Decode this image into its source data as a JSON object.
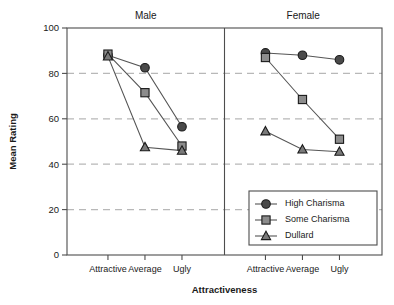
{
  "chart_data": {
    "type": "line",
    "title": "",
    "xlabel": "Attractiveness",
    "ylabel": "Mean Rating",
    "ylim": [
      0,
      100
    ],
    "yticks": [
      0,
      20,
      40,
      60,
      80,
      100
    ],
    "yticklabels": [
      "0",
      "20",
      "40",
      "60",
      "80",
      "100"
    ],
    "grid": "horizontal dashed at 20,40,60,80",
    "categories": [
      "Attractive",
      "Average",
      "Ugly"
    ],
    "panels": [
      {
        "name": "Male",
        "series": [
          {
            "name": "High Charisma",
            "marker": "circle",
            "values": [
              88.0,
              82.5,
              56.5
            ],
            "errors": [
              1.2,
              1.8,
              1.5
            ]
          },
          {
            "name": "Some Charisma",
            "marker": "square",
            "values": [
              88.5,
              71.5,
              48.0
            ],
            "errors": [
              1.3,
              1.5,
              1.5
            ]
          },
          {
            "name": "Dullard",
            "marker": "triangle",
            "values": [
              87.5,
              47.5,
              46.0
            ],
            "errors": [
              1.3,
              1.2,
              1.5
            ]
          }
        ]
      },
      {
        "name": "Female",
        "series": [
          {
            "name": "High Charisma",
            "marker": "circle",
            "values": [
              89.0,
              88.0,
              86.0
            ],
            "errors": [
              1.4,
              1.5,
              1.0
            ]
          },
          {
            "name": "Some Charisma",
            "marker": "square",
            "values": [
              87.0,
              68.5,
              51.0
            ],
            "errors": [
              1.4,
              1.3,
              1.2
            ]
          },
          {
            "name": "Dullard",
            "marker": "triangle",
            "values": [
              54.5,
              46.5,
              45.5
            ],
            "errors": [
              1.3,
              1.2,
              1.2
            ]
          }
        ]
      }
    ],
    "legend": {
      "position": "bottom-right",
      "entries": [
        {
          "label": "High Charisma",
          "marker": "circle"
        },
        {
          "label": "Some Charisma",
          "marker": "square"
        },
        {
          "label": "Dullard",
          "marker": "triangle"
        }
      ]
    },
    "colors": {
      "circle_fill": "#4a4a4a",
      "square_fill": "#8c8c8c",
      "triangle_fill": "#7a7a7a",
      "marker_stroke": "#1a1a1a",
      "line": "#555555",
      "grid": "#b8b8b8",
      "axis": "#4d4d4d",
      "text": "#1a1a1a"
    }
  }
}
